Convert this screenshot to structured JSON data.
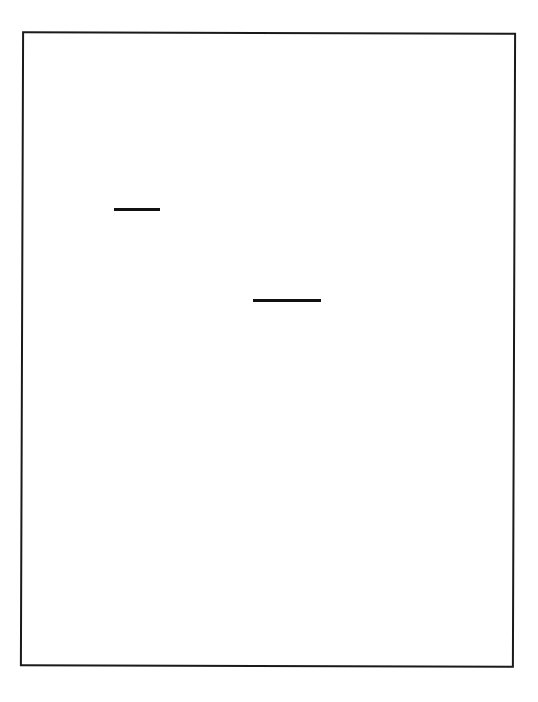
{
  "page": {
    "type": "scanned-blank-form",
    "background_color": "#ffffff",
    "frame": {
      "border_color": "#1a1a1a",
      "x": 21,
      "y": 32,
      "width": 492,
      "height": 635
    },
    "marks": [
      {
        "kind": "horizontal-dash",
        "x1": 114,
        "x2": 160,
        "y": 209,
        "color": "#111111"
      },
      {
        "kind": "horizontal-dash",
        "x1": 253,
        "x2": 321,
        "y": 300,
        "color": "#111111"
      }
    ],
    "text": []
  }
}
